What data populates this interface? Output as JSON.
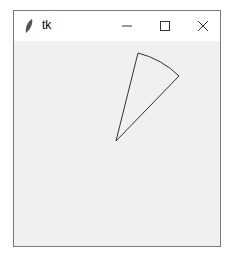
{
  "window": {
    "title": "tk",
    "controls": {
      "minimize": "minimize",
      "maximize": "maximize",
      "close": "close"
    }
  },
  "canvas": {
    "background": "#f0f0f0",
    "shapes": [
      {
        "type": "arc-pieslice",
        "center": [
          116,
          141
        ],
        "start_point": [
          138,
          53
        ],
        "end_point": [
          179,
          76
        ],
        "outline": "#333333",
        "fill": "none"
      }
    ]
  }
}
